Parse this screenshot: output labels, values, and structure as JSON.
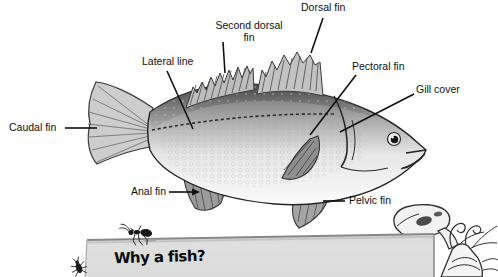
{
  "diagram": {
    "labels": [
      {
        "id": "caudal-fin",
        "text": "Caudal fin"
      },
      {
        "id": "dorsal-fin",
        "text": "Dorsal fin"
      },
      {
        "id": "second-dorsal-fin",
        "text": "Second dorsal fin"
      },
      {
        "id": "lateral-line",
        "text": "Lateral line"
      },
      {
        "id": "pectoral-fin",
        "text": "Pectoral fin"
      },
      {
        "id": "gill-cover",
        "text": "Gill cover"
      },
      {
        "id": "anal-fin",
        "text": "Anal fin"
      },
      {
        "id": "pelvic-fin",
        "text": "Pelvic fin"
      }
    ]
  },
  "card": {
    "heading": "Why a fish?"
  },
  "colors": {
    "background": "#ffffff",
    "ink": "#111111",
    "card_gray": "#dfdfdf",
    "fish_dark": "#4f4f4f",
    "fish_light": "#fafafa"
  }
}
